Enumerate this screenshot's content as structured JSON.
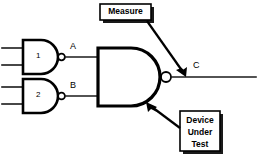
{
  "diagram": {
    "background_color": "#ffffff",
    "line_color": "#000000",
    "signals": {
      "a_label": "A",
      "b_label": "B",
      "c_label": "C"
    },
    "gates": [
      {
        "id": "gate-1",
        "number": "1",
        "type": "nand",
        "inputs": 2,
        "output_signal": "A"
      },
      {
        "id": "gate-2",
        "number": "2",
        "type": "nand",
        "inputs": 2,
        "output_signal": "B"
      },
      {
        "id": "gate-3",
        "number": "",
        "type": "nand",
        "inputs": 2,
        "output_signal": "C"
      }
    ],
    "callouts": [
      {
        "id": "measure-callout",
        "lines": [
          "Measure"
        ],
        "points_to": "output-node-c"
      },
      {
        "id": "device-under-test-callout",
        "lines": [
          "Device",
          "Under",
          "Test"
        ],
        "points_to": "gate-3-body"
      }
    ]
  }
}
